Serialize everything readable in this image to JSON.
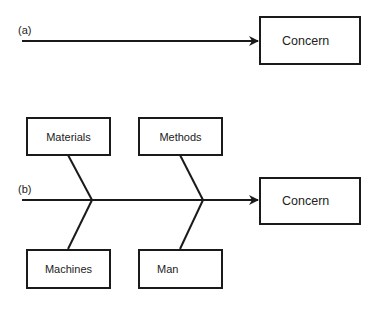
{
  "diagram_a": {
    "label": "(a)",
    "concern_label": "Concern"
  },
  "diagram_b": {
    "label": "(b)",
    "concern_label": "Concern",
    "categories": {
      "top_left": "Materials",
      "top_right": "Methods",
      "bottom_left": "Machines",
      "bottom_right": "Man"
    }
  },
  "colors": {
    "stroke": "#1a1a1a",
    "background": "#ffffff"
  }
}
